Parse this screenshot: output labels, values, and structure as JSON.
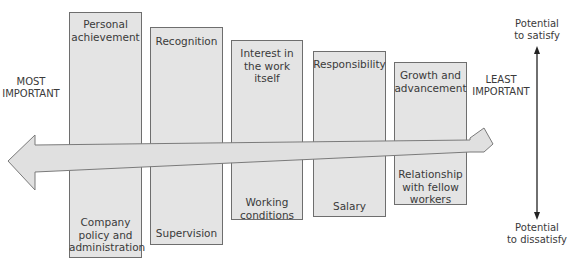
{
  "diagram": {
    "left_label": "MOST\nIMPORTANT",
    "right_label": "LEAST\nIMPORTANT",
    "axis_top_label": "Potential\nto satisfy",
    "axis_bottom_label": "Potential\nto dissatisfy",
    "columns": [
      {
        "motivator": "Personal\nachievement",
        "hygiene": "Company\npolicy and\nadministration"
      },
      {
        "motivator": "Recognition",
        "hygiene": "Supervision"
      },
      {
        "motivator": "Interest in\nthe work\nitself",
        "hygiene": "Working\nconditions"
      },
      {
        "motivator": "Responsibility",
        "hygiene": "Salary"
      },
      {
        "motivator": "Growth and\nadvancement",
        "hygiene": "Relationship\nwith fellow\nworkers"
      }
    ],
    "colors": {
      "box_fill": "#e4e4e4",
      "box_border": "#6e6e6e",
      "arrow_fill": "#e0e0e0",
      "axis": "#222222"
    }
  }
}
